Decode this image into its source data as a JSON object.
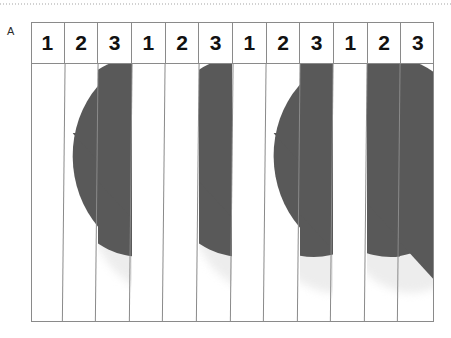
{
  "figure": {
    "panel_label": "A",
    "scan_line_icon": "dotted-scan-line"
  },
  "table": {
    "column_count": 12,
    "header_label": "Condition number",
    "headers": [
      {
        "label": "1"
      },
      {
        "label": "2"
      },
      {
        "label": "3"
      },
      {
        "label": "1"
      },
      {
        "label": "2"
      },
      {
        "label": "3"
      },
      {
        "label": "1"
      },
      {
        "label": "2"
      },
      {
        "label": "3"
      },
      {
        "label": "1"
      },
      {
        "label": "2"
      },
      {
        "label": "3"
      }
    ]
  },
  "stimulus": {
    "description": "heart-shaped figure sliced into vertical strips",
    "dark_color": "#595959",
    "light_color": "#ededed",
    "background_color": "#ffffff",
    "border_color": "#8a8a8a",
    "strips": [
      {
        "name": "strip-1",
        "left": 0,
        "width": 33.58,
        "offset": 0,
        "slant": 0.0
      },
      {
        "name": "strip-2",
        "left": 33.58,
        "width": 33.58,
        "offset": -52,
        "slant": 0.5
      },
      {
        "name": "strip-3",
        "left": 67.16,
        "width": 33.58,
        "offset": -104,
        "slant": 0.3
      },
      {
        "name": "strip-4",
        "left": 100.75,
        "width": 33.58,
        "offset": 12,
        "slant": 1.1
      },
      {
        "name": "strip-5",
        "left": 134.33,
        "width": 33.58,
        "offset": -16,
        "slant": 0.2
      },
      {
        "name": "strip-6",
        "left": 167.91,
        "width": 33.58,
        "offset": -104,
        "slant": 0.4
      },
      {
        "name": "strip-7",
        "left": 201.5,
        "width": 33.58,
        "offset": 6,
        "slant": 1.4
      },
      {
        "name": "strip-8",
        "left": 235.08,
        "width": 33.58,
        "offset": -52,
        "slant": 0.6
      },
      {
        "name": "strip-9",
        "left": 268.66,
        "width": 33.58,
        "offset": -134,
        "slant": 0.3
      },
      {
        "name": "strip-10",
        "left": 302.25,
        "width": 33.58,
        "offset": -18,
        "slant": 1.0
      },
      {
        "name": "strip-11",
        "left": 335.83,
        "width": 33.58,
        "offset": -124,
        "slant": 0.2
      },
      {
        "name": "strip-12",
        "left": 369.41,
        "width": 33.58,
        "offset": -160,
        "slant": 0.0
      }
    ]
  }
}
